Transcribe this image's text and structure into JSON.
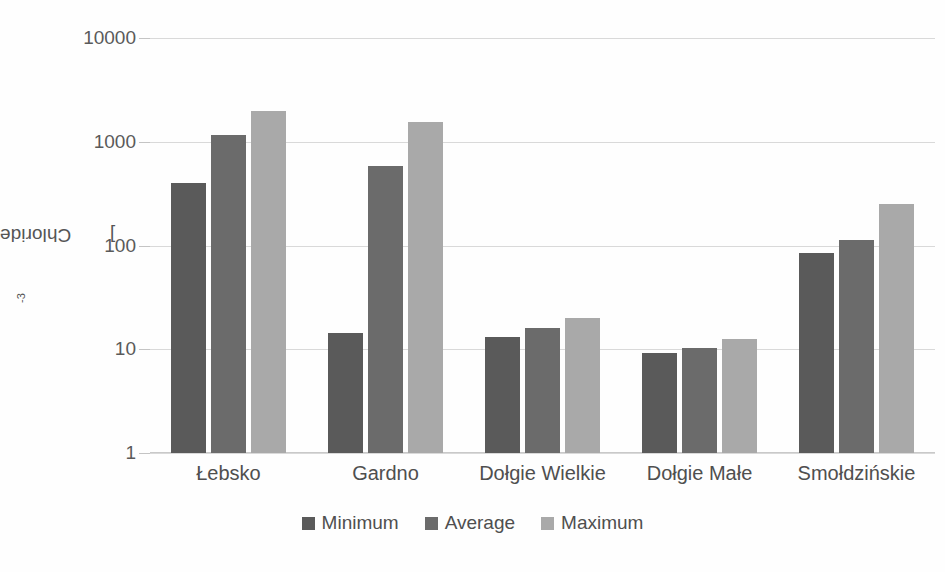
{
  "chart_data": {
    "type": "bar",
    "title": "",
    "xlabel": "",
    "ylabel": "Chloride [mgdm-3]",
    "ylabel_base": "Chloride [mgdm",
    "ylabel_sup": "-3",
    "ylabel_tail": "]",
    "yscale": "log",
    "ylim": [
      1,
      10000
    ],
    "ytick_labels": [
      "10000",
      "1000",
      "100",
      "10",
      "1"
    ],
    "ytick_values": [
      10000,
      1000,
      100,
      10,
      1
    ],
    "grid": true,
    "legend_position": "bottom",
    "categories": [
      "Łebsko",
      "Gardno",
      "Dołgie Wielkie",
      "Dołgie Małe",
      "Smołdzińskie"
    ],
    "series": [
      {
        "name": "Minimum",
        "color": "#5a5a5a",
        "values": [
          400,
          14.5,
          13.2,
          9.3,
          85
        ]
      },
      {
        "name": "Average",
        "color": "#6b6b6b",
        "values": [
          1150,
          580,
          16,
          10.3,
          112
        ]
      },
      {
        "name": "Maximum",
        "color": "#a9a9a9",
        "values": [
          2000,
          1550,
          20,
          12.5,
          250
        ]
      }
    ]
  },
  "legend": {
    "items": [
      {
        "label": "Minimum",
        "color": "#5a5a5a"
      },
      {
        "label": "Average",
        "color": "#6b6b6b"
      },
      {
        "label": "Maximum",
        "color": "#a9a9a9"
      }
    ]
  },
  "colors": {
    "background": "#fefefe",
    "gridline": "#d9d9d9",
    "text": "#4f4f4f",
    "minimum": "#5a5a5a",
    "average": "#6b6b6b",
    "maximum": "#a9a9a9"
  }
}
